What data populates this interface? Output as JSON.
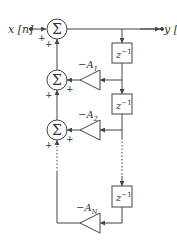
{
  "diagram": {
    "input_label": "x [n]",
    "output_label": "y [n]",
    "sum_symbol": "Σ",
    "plus": "+",
    "delay_label": "z",
    "delay_exp": "−1",
    "gains": [
      {
        "sign": "−A",
        "sub": "1"
      },
      {
        "sign": "−A",
        "sub": "2"
      },
      {
        "sign": "−A",
        "sub": "N"
      }
    ],
    "line_color": "#444444"
  }
}
